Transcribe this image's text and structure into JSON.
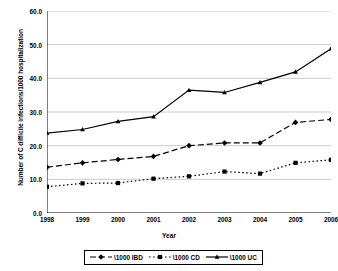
{
  "chart_data": {
    "type": "line",
    "title": "",
    "xlabel": "Year",
    "ylabel": "Number of C difficile infections/1000 hospitalization",
    "categories": [
      "1998",
      "1999",
      "2000",
      "2001",
      "2002",
      "2003",
      "2004",
      "2005",
      "2006"
    ],
    "xlim": [
      1998,
      2006
    ],
    "ylim": [
      0.0,
      60.0
    ],
    "ytick_labels": [
      "60.0",
      "50.0",
      "40.0",
      "30.0",
      "20.0",
      "10.0",
      "0.0"
    ],
    "ytick_values": [
      60.0,
      50.0,
      40.0,
      30.0,
      20.0,
      10.0,
      0.0
    ],
    "grid": "horizontal",
    "legend_position": "bottom",
    "series": [
      {
        "name": "\\1000 IBD",
        "marker": "diamond",
        "line_style": "dashed",
        "color": "#000000",
        "values": [
          13.6,
          14.9,
          15.9,
          16.8,
          20.0,
          20.8,
          20.8,
          26.9,
          27.8
        ]
      },
      {
        "name": "\\1000 CD",
        "marker": "square",
        "line_style": "dotted",
        "color": "#000000",
        "values": [
          7.8,
          8.8,
          8.9,
          10.2,
          10.9,
          12.3,
          11.7,
          14.9,
          15.8
        ]
      },
      {
        "name": "\\1000 UC",
        "marker": "triangle",
        "line_style": "solid",
        "color": "#000000",
        "values": [
          23.7,
          24.8,
          27.2,
          28.6,
          36.5,
          35.8,
          38.8,
          41.9,
          48.8
        ]
      }
    ]
  }
}
